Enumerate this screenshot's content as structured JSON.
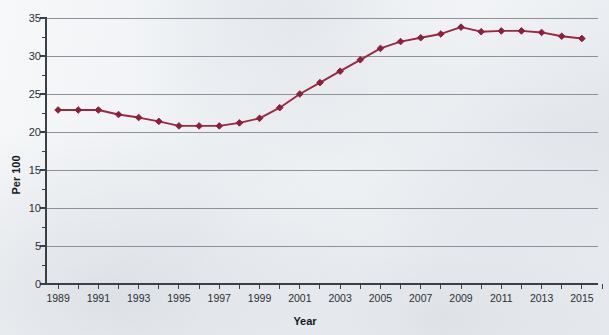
{
  "chart_data": {
    "type": "line",
    "title": "",
    "xlabel": "Year",
    "ylabel": "Per 100",
    "xlim": [
      1988.4,
      2015.8
    ],
    "ylim": [
      0,
      35
    ],
    "yticks": [
      0,
      5,
      10,
      15,
      20,
      25,
      30,
      35
    ],
    "xticks_labeled": [
      1989,
      1991,
      1993,
      1995,
      1997,
      1999,
      2001,
      2003,
      2005,
      2007,
      2009,
      2011,
      2013,
      2015
    ],
    "xtick_step_minor": 1,
    "grid": "horizontal",
    "legend": "none",
    "line_color": "#9c2743",
    "marker": "diamond",
    "x": [
      1989,
      1990,
      1991,
      1992,
      1993,
      1994,
      1995,
      1996,
      1997,
      1998,
      1999,
      2000,
      2001,
      2002,
      2003,
      2004,
      2005,
      2006,
      2007,
      2008,
      2009,
      2010,
      2011,
      2012,
      2013,
      2014,
      2015
    ],
    "values": [
      22.9,
      22.9,
      22.9,
      22.3,
      21.9,
      21.4,
      20.8,
      20.8,
      20.8,
      21.2,
      21.8,
      23.2,
      25.0,
      26.5,
      28.0,
      29.5,
      31.0,
      31.9,
      32.4,
      32.9,
      33.8,
      33.2,
      33.3,
      33.3,
      33.1,
      32.6,
      32.3
    ],
    "series": [
      {
        "name": "Per 100",
        "values": [
          22.9,
          22.9,
          22.9,
          22.3,
          21.9,
          21.4,
          20.8,
          20.8,
          20.8,
          21.2,
          21.8,
          23.2,
          25.0,
          26.5,
          28.0,
          29.5,
          31.0,
          31.9,
          32.4,
          32.9,
          33.8,
          33.2,
          33.3,
          33.3,
          33.1,
          32.6,
          32.3
        ]
      }
    ]
  },
  "labels": {
    "y_axis_title": "Per 100",
    "x_axis_title": "Year",
    "y_tick_0": "0",
    "y_tick_5": "5",
    "y_tick_10": "10",
    "y_tick_15": "15",
    "y_tick_20": "20",
    "y_tick_25": "25",
    "y_tick_30": "30",
    "y_tick_35": "35"
  },
  "colors": {
    "line": "#9c2743",
    "marker": "#8e1f3a",
    "grid": "#8c9298",
    "axis": "#3b4046",
    "background": "#f2f4f6"
  }
}
